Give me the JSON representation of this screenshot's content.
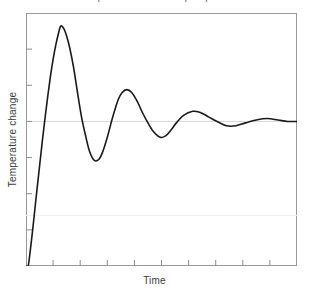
{
  "figure": {
    "caption": "Underdamped second-order step response",
    "caption_visible": "partially-cropped-top-edge"
  },
  "axes": {
    "x_label": "Time",
    "y_label": "Temperature change"
  },
  "chart_data": {
    "type": "line",
    "title": "Underdamped second-order step response",
    "xlabel": "Time",
    "ylabel": "Temperature change",
    "grid": true,
    "legend": false,
    "x_tick_labels": [],
    "y_tick_labels": [],
    "x_tick_count": 9,
    "y_tick_count": 6,
    "xlim": [
      0,
      10
    ],
    "ylim": [
      0,
      1.75
    ],
    "gridlines_y": [
      1.0,
      0.35
    ],
    "steady_state": 1.0,
    "model": {
      "form": "1 - exp(-zeta*wn*t)*cos(wd*t)",
      "zeta_wn": 0.58,
      "wd": 2.62,
      "t_start": 0.08
    },
    "features": {
      "first_peak": {
        "t": 1.28,
        "value": 1.66
      },
      "first_trough": {
        "t": 2.52,
        "value": 0.73
      },
      "second_peak": {
        "t": 3.72,
        "value": 1.22
      },
      "second_trough": {
        "t": 4.95,
        "value": 0.89
      },
      "third_peak": {
        "t": 6.15,
        "value": 1.07
      },
      "settles_to": 1.0
    },
    "series": [
      {
        "name": "Temperature change",
        "color": "#1a1a1a",
        "x": [
          0.0,
          0.08,
          0.16,
          0.24,
          0.32,
          0.4,
          0.5,
          0.6,
          0.7,
          0.8,
          0.9,
          1.0,
          1.1,
          1.2,
          1.28,
          1.4,
          1.5,
          1.6,
          1.75,
          1.9,
          2.05,
          2.2,
          2.35,
          2.52,
          2.7,
          2.85,
          3.0,
          3.2,
          3.4,
          3.55,
          3.72,
          3.9,
          4.1,
          4.3,
          4.5,
          4.7,
          4.95,
          5.15,
          5.35,
          5.55,
          5.8,
          6.15,
          6.45,
          6.75,
          7.05,
          7.4,
          7.75,
          8.1,
          8.5,
          8.9,
          9.3,
          9.65,
          10.0
        ],
        "y": [
          0.0,
          0.0,
          0.11,
          0.24,
          0.38,
          0.52,
          0.69,
          0.86,
          1.02,
          1.17,
          1.31,
          1.43,
          1.53,
          1.61,
          1.66,
          1.64,
          1.59,
          1.52,
          1.38,
          1.2,
          1.03,
          0.9,
          0.79,
          0.73,
          0.74,
          0.8,
          0.89,
          1.03,
          1.15,
          1.2,
          1.22,
          1.2,
          1.14,
          1.06,
          0.99,
          0.93,
          0.89,
          0.9,
          0.94,
          0.99,
          1.04,
          1.07,
          1.06,
          1.03,
          1.0,
          0.97,
          0.97,
          0.99,
          1.01,
          1.02,
          1.01,
          1.0,
          1.0
        ]
      }
    ]
  },
  "style": {
    "curve_color": "#1a1a1a",
    "frame_color": "#9a9a9a",
    "gridline_color": "#d8d8d8",
    "gridline_faint_color": "#eeeeee",
    "tick_color": "#8c8c8c",
    "label_color": "#3c3c3c",
    "background": "#ffffff"
  }
}
